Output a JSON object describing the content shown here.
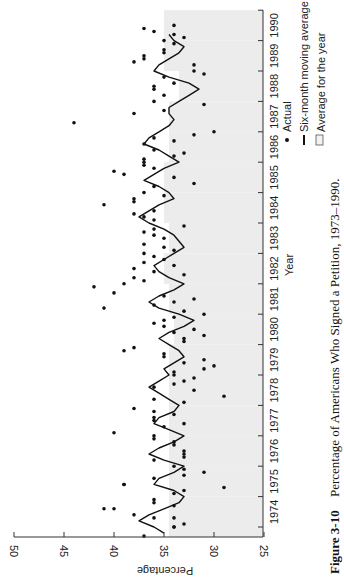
{
  "figure": {
    "label": "Figure 3-10",
    "caption": "Percentage of Americans Who Signed a Petition, 1973–1990."
  },
  "legend": {
    "items": [
      {
        "symbol": "dot",
        "label": "Actual"
      },
      {
        "symbol": "line",
        "label": "Six-month moving average"
      },
      {
        "symbol": "box",
        "label": "Average for the year"
      }
    ]
  },
  "colors": {
    "points": "#111111",
    "line": "#111111",
    "shade": "#ececec",
    "axis": "#333333"
  },
  "chart_data": {
    "type": "line",
    "title": "Percentage of Americans Who Signed a Petition, 1973–1990",
    "xlabel": "Year",
    "ylabel": "Percentage",
    "orientation": "rotated 90° counterclockwise (years run bottom-to-top on right; percentage runs right-to-left along bottom)",
    "x_ticks": [
      "1974",
      "1975",
      "1976",
      "1977",
      "1978",
      "1979",
      "1980",
      "1981",
      "1982",
      "1983",
      "1984",
      "1985",
      "1986",
      "1987",
      "1988",
      "1989",
      "1990"
    ],
    "y_ticks": [
      50,
      45,
      40,
      35,
      30,
      25
    ],
    "ylim": [
      25,
      50
    ],
    "xlim": [
      1973.5,
      1990.5
    ],
    "grid": false,
    "legend_position": "right, beside year axis",
    "series": [
      {
        "name": "Six-month moving average",
        "type": "line",
        "x": [
          1973.8,
          1974.0,
          1974.2,
          1974.4,
          1974.6,
          1974.8,
          1975.0,
          1975.2,
          1975.4,
          1975.6,
          1975.8,
          1976.0,
          1976.2,
          1976.4,
          1976.6,
          1976.8,
          1977.0,
          1977.2,
          1977.4,
          1977.6,
          1977.8,
          1978.0,
          1978.2,
          1978.4,
          1978.6,
          1978.8,
          1979.0,
          1979.2,
          1979.4,
          1979.6,
          1979.8,
          1980.0,
          1980.2,
          1980.4,
          1980.6,
          1980.8,
          1981.0,
          1981.2,
          1981.4,
          1981.6,
          1981.8,
          1982.0,
          1982.2,
          1982.4,
          1982.6,
          1982.8,
          1983.0,
          1983.2,
          1983.4,
          1983.6,
          1983.8,
          1984.0,
          1984.2,
          1984.4,
          1984.6,
          1984.8,
          1985.0,
          1985.2,
          1985.4,
          1985.6,
          1985.8,
          1986.0,
          1986.2,
          1986.4,
          1986.6,
          1986.8,
          1987.0,
          1987.2,
          1987.4,
          1987.6,
          1987.8,
          1988.0,
          1988.2,
          1988.4,
          1988.6,
          1988.8,
          1989.0,
          1989.2,
          1989.4,
          1989.6,
          1989.8,
          1990.0,
          1990.2
        ],
        "values": [
          35.0,
          36.0,
          37.5,
          36.5,
          35.0,
          33.5,
          33.0,
          34.0,
          36.0,
          35.5,
          34.0,
          33.0,
          35.0,
          36.5,
          35.5,
          34.0,
          33.0,
          34.5,
          36.0,
          35.5,
          34.0,
          33.5,
          34.5,
          35.5,
          36.5,
          35.5,
          34.5,
          35.0,
          34.0,
          33.0,
          33.5,
          34.5,
          35.5,
          34.5,
          33.0,
          32.0,
          33.5,
          35.5,
          36.5,
          35.5,
          34.0,
          33.0,
          34.5,
          35.5,
          36.0,
          35.0,
          34.0,
          33.0,
          33.5,
          34.0,
          35.0,
          36.5,
          37.5,
          36.5,
          35.5,
          34.0,
          34.5,
          35.5,
          37.0,
          36.0,
          35.0,
          33.5,
          34.5,
          35.5,
          37.0,
          36.5,
          35.5,
          34.5,
          34.0,
          34.5,
          34.5,
          33.5,
          32.5,
          31.5,
          32.5,
          34.5,
          36.0,
          35.5,
          34.5,
          33.5,
          33.0,
          34.0,
          34.5
        ]
      },
      {
        "name": "Actual",
        "type": "scatter",
        "points": [
          [
            1973.7,
            37
          ],
          [
            1974.0,
            34
          ],
          [
            1974.0,
            34
          ],
          [
            1974.1,
            33
          ],
          [
            1974.3,
            36
          ],
          [
            1974.3,
            34
          ],
          [
            1974.4,
            38
          ],
          [
            1974.6,
            41
          ],
          [
            1974.6,
            40
          ],
          [
            1974.7,
            34
          ],
          [
            1974.8,
            36
          ],
          [
            1974.9,
            36
          ],
          [
            1975.1,
            34
          ],
          [
            1975.2,
            33
          ],
          [
            1975.3,
            29
          ],
          [
            1975.4,
            39
          ],
          [
            1975.4,
            39
          ],
          [
            1975.6,
            36
          ],
          [
            1975.7,
            33
          ],
          [
            1975.8,
            31
          ],
          [
            1975.9,
            33
          ],
          [
            1976.0,
            34
          ],
          [
            1976.2,
            36
          ],
          [
            1976.3,
            33
          ],
          [
            1976.4,
            33
          ],
          [
            1976.5,
            33
          ],
          [
            1976.7,
            34
          ],
          [
            1976.8,
            34
          ],
          [
            1976.9,
            36
          ],
          [
            1977.0,
            36
          ],
          [
            1977.1,
            40
          ],
          [
            1977.3,
            35
          ],
          [
            1977.4,
            33
          ],
          [
            1977.5,
            36
          ],
          [
            1977.6,
            36
          ],
          [
            1977.7,
            34
          ],
          [
            1977.8,
            36
          ],
          [
            1977.9,
            38
          ],
          [
            1978.1,
            33
          ],
          [
            1978.2,
            36
          ],
          [
            1978.3,
            29
          ],
          [
            1978.5,
            32
          ],
          [
            1978.6,
            36
          ],
          [
            1978.7,
            34
          ],
          [
            1978.8,
            33
          ],
          [
            1978.9,
            32
          ],
          [
            1979.0,
            34
          ],
          [
            1979.1,
            34
          ],
          [
            1979.2,
            31
          ],
          [
            1979.3,
            30
          ],
          [
            1979.4,
            33
          ],
          [
            1979.5,
            31
          ],
          [
            1979.6,
            35
          ],
          [
            1979.7,
            35
          ],
          [
            1979.8,
            39
          ],
          [
            1979.9,
            38
          ],
          [
            1980.1,
            33
          ],
          [
            1980.2,
            33
          ],
          [
            1980.3,
            31
          ],
          [
            1980.4,
            34
          ],
          [
            1980.5,
            32
          ],
          [
            1980.6,
            35
          ],
          [
            1980.7,
            36
          ],
          [
            1980.8,
            35
          ],
          [
            1980.9,
            34
          ],
          [
            1981.0,
            31
          ],
          [
            1981.1,
            33
          ],
          [
            1981.2,
            41
          ],
          [
            1981.3,
            36
          ],
          [
            1981.4,
            34
          ],
          [
            1981.5,
            32
          ],
          [
            1981.6,
            35
          ],
          [
            1981.7,
            40
          ],
          [
            1981.9,
            42
          ],
          [
            1982.0,
            39
          ],
          [
            1982.1,
            37
          ],
          [
            1982.2,
            38
          ],
          [
            1982.3,
            33
          ],
          [
            1982.4,
            36
          ],
          [
            1982.5,
            38
          ],
          [
            1982.6,
            34
          ],
          [
            1982.7,
            37
          ],
          [
            1982.8,
            35
          ],
          [
            1982.9,
            36
          ],
          [
            1983.0,
            37
          ],
          [
            1983.1,
            34
          ],
          [
            1983.2,
            35
          ],
          [
            1983.3,
            37
          ],
          [
            1983.5,
            35
          ],
          [
            1983.6,
            36
          ],
          [
            1983.7,
            37
          ],
          [
            1983.8,
            36
          ],
          [
            1983.9,
            33
          ],
          [
            1984.1,
            36
          ],
          [
            1984.2,
            37
          ],
          [
            1984.3,
            38
          ],
          [
            1984.4,
            36
          ],
          [
            1984.6,
            41
          ],
          [
            1984.7,
            38
          ],
          [
            1984.8,
            38
          ],
          [
            1984.9,
            35
          ],
          [
            1985.0,
            37
          ],
          [
            1985.2,
            36
          ],
          [
            1985.3,
            32
          ],
          [
            1985.5,
            34
          ],
          [
            1985.6,
            39
          ],
          [
            1985.7,
            40
          ],
          [
            1985.8,
            36
          ],
          [
            1985.9,
            37
          ],
          [
            1986.0,
            37
          ],
          [
            1986.1,
            37
          ],
          [
            1986.2,
            34
          ],
          [
            1986.3,
            33
          ],
          [
            1986.4,
            36
          ],
          [
            1986.6,
            37
          ],
          [
            1986.7,
            34
          ],
          [
            1986.8,
            36
          ],
          [
            1986.9,
            32
          ],
          [
            1987.0,
            30
          ],
          [
            1987.3,
            44
          ],
          [
            1987.6,
            38
          ],
          [
            1987.7,
            35
          ],
          [
            1987.9,
            31
          ],
          [
            1988.0,
            36
          ],
          [
            1988.2,
            35
          ],
          [
            1988.4,
            36
          ],
          [
            1988.5,
            36
          ],
          [
            1988.6,
            34
          ],
          [
            1988.8,
            35
          ],
          [
            1988.9,
            31
          ],
          [
            1989.0,
            32
          ],
          [
            1989.2,
            32
          ],
          [
            1989.3,
            38
          ],
          [
            1989.4,
            37
          ],
          [
            1989.5,
            37
          ],
          [
            1989.6,
            35
          ],
          [
            1989.7,
            35
          ],
          [
            1989.9,
            34
          ],
          [
            1990.0,
            35
          ],
          [
            1990.1,
            33
          ],
          [
            1990.2,
            34
          ],
          [
            1990.3,
            36
          ],
          [
            1990.4,
            37
          ],
          [
            1990.5,
            34
          ]
        ]
      },
      {
        "name": "Average for the year",
        "type": "area",
        "categories": [
          "1974",
          "1975",
          "1976",
          "1977",
          "1978",
          "1979",
          "1980",
          "1981",
          "1982",
          "1983",
          "1984",
          "1985",
          "1986",
          "1987",
          "1988",
          "1989",
          "1990"
        ],
        "values": [
          34.5,
          34.5,
          34.5,
          34.5,
          34.5,
          34.5,
          34.0,
          34.5,
          35.0,
          34.5,
          35.0,
          35.0,
          34.5,
          34.5,
          33.5,
          35.0,
          35.0
        ]
      }
    ]
  }
}
